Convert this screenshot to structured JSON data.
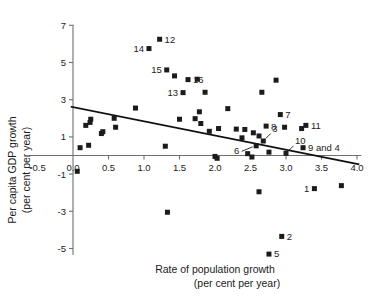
{
  "chart_data": {
    "type": "scatter",
    "title": "",
    "xlabel": "Rate of population growth (per cent per year)",
    "ylabel": "Per capita GDP growth (per cent per year)",
    "xlabel_line1": "Rate of population growth",
    "xlabel_line2": "(per cent per year)",
    "ylabel_line1": "Per capita GDP growth",
    "ylabel_line2": "(per cent per year)",
    "xlim": [
      -0.75,
      4.15
    ],
    "ylim": [
      -5.9,
      7.4
    ],
    "xticks": [
      -0.5,
      0.0,
      0.5,
      1.0,
      1.5,
      2.0,
      2.5,
      3.0,
      3.5,
      4.0
    ],
    "xticklabels": [
      "-0.5",
      "0.0",
      "0.5",
      "1.0",
      "1.5",
      "2.0",
      "2.5",
      "3.0",
      "3.5",
      "4.0"
    ],
    "yticks": [
      7,
      5,
      3,
      1,
      -1,
      -3,
      -5
    ],
    "yticklabels": [
      "7",
      "5",
      "3",
      "1",
      "-1",
      "-3",
      "-5"
    ],
    "grid": false,
    "legend": "none",
    "trendline": {
      "x0": -0.02,
      "y0": 2.62,
      "x1": 4.02,
      "y1": -0.47
    },
    "points": [
      {
        "x": 0.06,
        "y": -0.85,
        "label": ""
      },
      {
        "x": 0.1,
        "y": 0.42,
        "label": ""
      },
      {
        "x": 0.22,
        "y": 0.55,
        "label": ""
      },
      {
        "x": 0.18,
        "y": 1.62,
        "label": ""
      },
      {
        "x": 0.25,
        "y": 1.95,
        "label": ""
      },
      {
        "x": 0.24,
        "y": 1.78,
        "label": ""
      },
      {
        "x": 0.42,
        "y": 1.28,
        "label": ""
      },
      {
        "x": 0.4,
        "y": 1.18,
        "label": ""
      },
      {
        "x": 0.58,
        "y": 2.0,
        "label": ""
      },
      {
        "x": 0.6,
        "y": 1.52,
        "label": ""
      },
      {
        "x": 0.88,
        "y": 2.55,
        "label": ""
      },
      {
        "x": 1.22,
        "y": 6.25,
        "label": "12",
        "lpos": "right"
      },
      {
        "x": 1.07,
        "y": 5.75,
        "label": "14",
        "lpos": "left"
      },
      {
        "x": 1.32,
        "y": 4.6,
        "label": "15",
        "lpos": "left"
      },
      {
        "x": 1.43,
        "y": 4.28,
        "label": ""
      },
      {
        "x": 1.62,
        "y": 4.08,
        "label": "16",
        "lpos": "right"
      },
      {
        "x": 1.3,
        "y": 0.5,
        "label": ""
      },
      {
        "x": 1.33,
        "y": -3.05,
        "label": ""
      },
      {
        "x": 1.55,
        "y": 3.38,
        "label": "13",
        "lpos": "left"
      },
      {
        "x": 1.75,
        "y": 4.1,
        "label": ""
      },
      {
        "x": 1.5,
        "y": 1.95,
        "label": ""
      },
      {
        "x": 1.72,
        "y": 1.98,
        "label": ""
      },
      {
        "x": 1.78,
        "y": 2.35,
        "label": ""
      },
      {
        "x": 1.8,
        "y": 1.72,
        "label": ""
      },
      {
        "x": 1.86,
        "y": 3.4,
        "label": ""
      },
      {
        "x": 1.92,
        "y": 1.3,
        "label": ""
      },
      {
        "x": 2.0,
        "y": -0.05,
        "label": ""
      },
      {
        "x": 2.03,
        "y": -0.15,
        "label": ""
      },
      {
        "x": 2.05,
        "y": 1.45,
        "label": ""
      },
      {
        "x": 2.18,
        "y": 2.52,
        "label": ""
      },
      {
        "x": 2.3,
        "y": 1.42,
        "label": ""
      },
      {
        "x": 2.38,
        "y": 0.95,
        "label": ""
      },
      {
        "x": 2.42,
        "y": 1.4,
        "label": ""
      },
      {
        "x": 2.46,
        "y": 0.1,
        "label": ""
      },
      {
        "x": 2.52,
        "y": -0.08,
        "label": ""
      },
      {
        "x": 2.54,
        "y": 1.22,
        "label": ""
      },
      {
        "x": 2.58,
        "y": 0.52,
        "label": "6",
        "lpos": "leader-left"
      },
      {
        "x": 2.62,
        "y": 1.05,
        "label": ""
      },
      {
        "x": 2.66,
        "y": 3.4,
        "label": ""
      },
      {
        "x": 2.68,
        "y": 0.78,
        "label": "3",
        "lpos": "leader-up"
      },
      {
        "x": 2.72,
        "y": 1.58,
        "label": "8",
        "lpos": "right"
      },
      {
        "x": 2.76,
        "y": 0.18,
        "label": ""
      },
      {
        "x": 2.62,
        "y": -1.95,
        "label": ""
      },
      {
        "x": 2.86,
        "y": 4.05,
        "label": ""
      },
      {
        "x": 2.92,
        "y": 2.2,
        "label": "7",
        "lpos": "right"
      },
      {
        "x": 2.98,
        "y": 1.52,
        "label": ""
      },
      {
        "x": 3.0,
        "y": 0.12,
        "label": "10",
        "lpos": "leader-up"
      },
      {
        "x": 3.22,
        "y": 1.45,
        "label": ""
      },
      {
        "x": 3.24,
        "y": 0.42,
        "label": "9 and 4",
        "lpos": "right"
      },
      {
        "x": 3.28,
        "y": 1.62,
        "label": "11",
        "lpos": "right"
      },
      {
        "x": 3.4,
        "y": -1.78,
        "label": "1",
        "lpos": "left"
      },
      {
        "x": 3.78,
        "y": -1.62,
        "label": ""
      },
      {
        "x": 2.94,
        "y": -4.35,
        "label": "2",
        "lpos": "right"
      },
      {
        "x": 2.76,
        "y": -5.3,
        "label": "5",
        "lpos": "right"
      }
    ]
  }
}
